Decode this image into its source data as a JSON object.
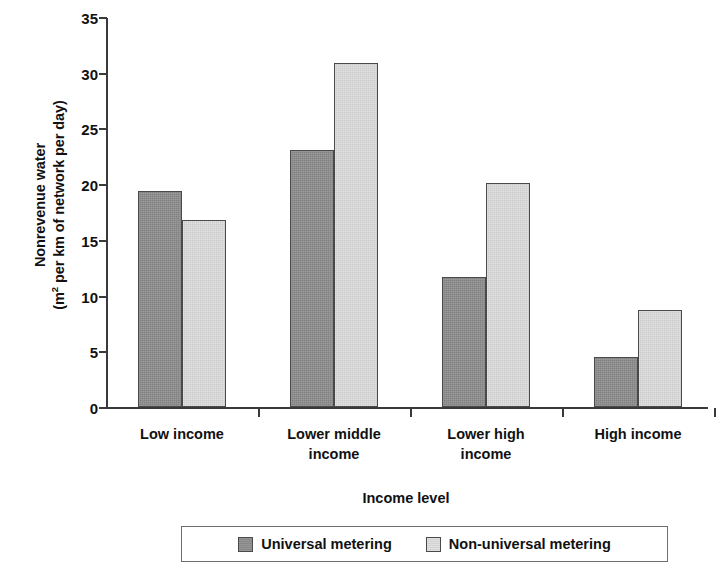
{
  "chart_data": {
    "type": "bar",
    "title": "",
    "categories": [
      "Low income",
      "Lower middle income",
      "Lower high income",
      "High income"
    ],
    "category_lines": [
      [
        "Low income"
      ],
      [
        "Lower middle",
        "income"
      ],
      [
        "Lower high",
        "income"
      ],
      [
        "High income"
      ]
    ],
    "series": [
      {
        "name": "Universal metering",
        "values": [
          19.4,
          23.1,
          11.7,
          4.5
        ],
        "color": "#8f8f8f"
      },
      {
        "name": "Non-universal metering",
        "values": [
          16.8,
          30.9,
          20.1,
          8.7
        ],
        "color": "#dedede"
      }
    ],
    "xlabel": "Income level",
    "ylabel_line1": "Nonrevenue water",
    "ylabel_line2_prefix": "(m",
    "ylabel_line2_sup": "2",
    "ylabel_line2_suffix": " per km of network per day)",
    "ylim": [
      0,
      35
    ],
    "yticks": [
      0,
      5,
      10,
      15,
      20,
      25,
      30,
      35
    ],
    "ytick_labels": [
      "0",
      "5",
      "10",
      "15",
      "20",
      "25",
      "30",
      "35"
    ],
    "grid": false,
    "legend_position": "bottom",
    "axis_color": "#3a3a3a",
    "bar_edge_color": "#4a4a4a"
  }
}
